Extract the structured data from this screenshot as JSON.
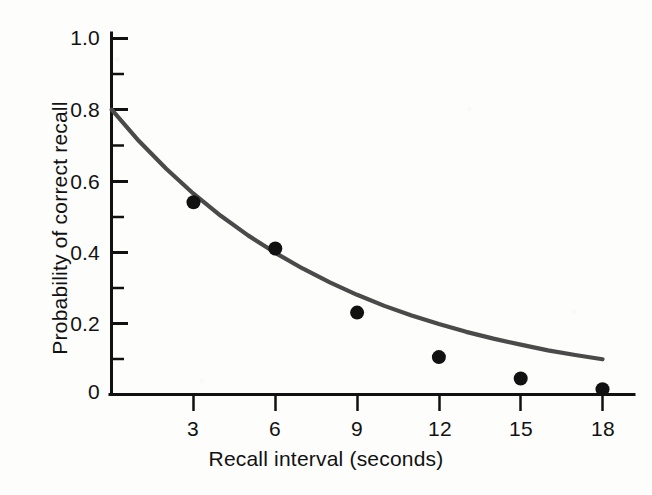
{
  "chart_data": {
    "type": "scatter",
    "title": "",
    "xlabel": "Recall interval (seconds)",
    "ylabel": "Probability of correct recall",
    "x": [
      3,
      6,
      9,
      12,
      15,
      18
    ],
    "values": [
      0.54,
      0.41,
      0.23,
      0.105,
      0.045,
      0.015
    ],
    "series": [
      {
        "name": "Observed recall probability",
        "type": "scatter",
        "x": [
          3,
          6,
          9,
          12,
          15,
          18
        ],
        "values": [
          0.54,
          0.41,
          0.23,
          0.105,
          0.045,
          0.015
        ],
        "marker": "filled-circle",
        "color": "#111111"
      },
      {
        "name": "Fitted decay curve",
        "type": "line",
        "x": [
          0,
          1,
          2,
          3,
          4,
          5,
          6,
          7,
          8,
          9,
          10,
          11,
          12,
          13,
          14,
          15,
          16,
          17,
          18
        ],
        "values": [
          0.8,
          0.712,
          0.634,
          0.564,
          0.502,
          0.447,
          0.398,
          0.354,
          0.315,
          0.28,
          0.249,
          0.222,
          0.198,
          0.176,
          0.157,
          0.14,
          0.124,
          0.111,
          0.099
        ],
        "color": "#4a4a4a"
      }
    ],
    "xlim": [
      0,
      19
    ],
    "ylim": [
      0,
      1.0
    ],
    "x_ticks": [
      "3",
      "6",
      "9",
      "12",
      "15",
      "18"
    ],
    "y_ticks": [
      "0",
      "0.2",
      "0.4",
      "0.6",
      "0.8",
      "1.0"
    ],
    "y_minor_ticks": [
      0.1,
      0.3,
      0.5,
      0.7,
      0.9
    ],
    "grid": false,
    "legend": "none",
    "curve_start_value": 0.8,
    "curve_end_value": 0.015,
    "axis_color": "#111111",
    "curve_color": "#4a4a4a",
    "point_color": "#111111",
    "background_color": "#fdfdfc"
  },
  "axes": {
    "y_tick_labels": [
      "1.0",
      "0.8",
      "0.6",
      "0.4",
      "0.2",
      "0"
    ],
    "x_tick_labels": [
      "3",
      "6",
      "9",
      "12",
      "15",
      "18"
    ],
    "x_title": "Recall interval (seconds)",
    "y_title": "Probability of correct recall"
  }
}
